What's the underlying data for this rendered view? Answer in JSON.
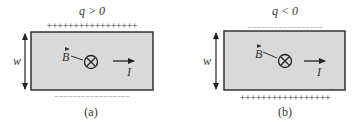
{
  "panels": [
    {
      "id": "a",
      "caption": "(a)",
      "charge_label": "q > 0",
      "top_charges": "+++++++++++++++++",
      "bottom_charges": "– – – – – – – – – – – – – – – – –",
      "width_label": "w",
      "field_label": "B",
      "current_label": "I",
      "field_direction": "into-page"
    },
    {
      "id": "b",
      "caption": "(b)",
      "charge_label": "q < 0",
      "top_charges": "– – – – – – – – – – – – – – – – –",
      "bottom_charges": "+++++++++++++++++",
      "width_label": "w",
      "field_label": "B",
      "current_label": "I",
      "field_direction": "into-page"
    }
  ],
  "colors": {
    "fill": "#d9d9d9",
    "stroke": "#333333",
    "text": "#333333"
  }
}
